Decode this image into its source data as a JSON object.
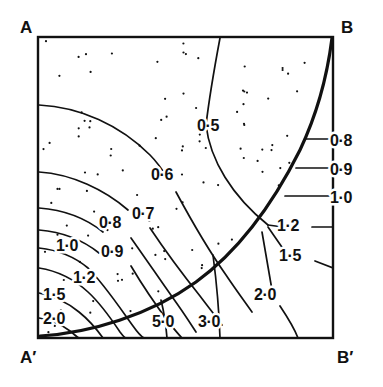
{
  "figure": {
    "title": "",
    "corner_labels": [
      {
        "name": "top-left",
        "text": "A",
        "x": 20,
        "y": 33
      },
      {
        "name": "top-right",
        "text": "B",
        "x": 341,
        "y": 33
      },
      {
        "name": "bottom-left",
        "text": "A′",
        "x": 20,
        "y": 363
      },
      {
        "name": "bottom-right",
        "text": "B′",
        "x": 337,
        "y": 363
      }
    ],
    "frame": {
      "x": 38,
      "y": 37,
      "width": 295,
      "height": 301,
      "stroke": "#111111",
      "fill": "#ffffff"
    },
    "stipple": {
      "description": "random dot shading of the region above/left of the thick boundary curve",
      "dot_color": "#111111",
      "dot_radius": 1.1,
      "count": 150
    }
  },
  "chart_data": {
    "type": "line",
    "title": "",
    "xlabel": "",
    "ylabel": "",
    "grid": false,
    "legend": "none",
    "contour_labels": [
      {
        "value": "0·5",
        "x": 208,
        "y": 131
      },
      {
        "value": "0·6",
        "x": 162,
        "y": 180
      },
      {
        "value": "0·7",
        "x": 143,
        "y": 219
      },
      {
        "value": "0·8",
        "x": 110,
        "y": 228
      },
      {
        "value": "0·9",
        "x": 112,
        "y": 257
      },
      {
        "value": "1·0",
        "x": 67,
        "y": 251
      },
      {
        "value": "1·2",
        "x": 84,
        "y": 283
      },
      {
        "value": "1·5",
        "x": 54,
        "y": 300
      },
      {
        "value": "2·0",
        "x": 54,
        "y": 324
      },
      {
        "value": "5·0",
        "x": 163,
        "y": 327
      },
      {
        "value": "3·0",
        "x": 209,
        "y": 327
      },
      {
        "value": "0·8",
        "x": 341,
        "y": 146
      },
      {
        "value": "0·9",
        "x": 341,
        "y": 175
      },
      {
        "value": "1·0",
        "x": 341,
        "y": 203
      },
      {
        "value": "1·2",
        "x": 288,
        "y": 231
      },
      {
        "value": "1·5",
        "x": 290,
        "y": 261
      },
      {
        "value": "2·0",
        "x": 265,
        "y": 300
      }
    ],
    "levels": [
      "0·5",
      "0·6",
      "0·7",
      "0·8",
      "0·9",
      "1·0",
      "1·2",
      "1·5",
      "2·0",
      "3·0",
      "5·0"
    ],
    "curves": [
      {
        "name": "boundary",
        "label": "",
        "weight": "thick",
        "path": "M 40,336 C 90,333 150,315 196,282 C 240,250 275,200 300,150 C 318,112 328,70 332,38"
      },
      {
        "name": "c-0.5",
        "label": "0·5",
        "path": "M 220,38 C 214,70 209,100 206,125 C 210,160 232,196 268,225"
      },
      {
        "name": "c-0.6-left",
        "label": "0·6",
        "path": "M 39,105 C 80,107 120,125 150,155 C 158,163 164,172 169,180"
      },
      {
        "name": "c-0.6-right",
        "label": "0·6",
        "path": "M 176,192 C 190,218 207,248 226,275 C 236,290 245,302 252,312"
      },
      {
        "name": "c-0.7-left",
        "label": "0·7",
        "path": "M 39,172 C 72,174 105,190 128,210"
      },
      {
        "name": "c-0.7-right",
        "label": "0·7",
        "path": "M 150,228 C 166,252 184,276 200,296 C 209,308 217,318 222,325"
      },
      {
        "name": "c-0.8-left",
        "label": "0·8",
        "path": "M 39,208 C 66,210 88,220 103,232"
      },
      {
        "name": "c-0.8-right",
        "label": "0·8",
        "path": "M 131,238 C 148,262 165,287 180,308 C 187,318 192,326 196,332"
      },
      {
        "name": "c-0.9-left",
        "label": "0·9",
        "path": "M 39,230 C 63,232 84,241 99,253"
      },
      {
        "name": "c-0.9-right",
        "label": "0·9",
        "path": "M 131,266 C 144,288 158,308 170,324 C 175,330 179,335 182,338"
      },
      {
        "name": "c-1.0",
        "label": "1·0",
        "path": "M 39,248 C 58,250 76,258 88,268 C 104,284 120,308 133,326 C 138,333 142,337 144,338"
      },
      {
        "name": "c-1.2",
        "label": "1·2",
        "path": "M 39,268 C 58,271 75,280 88,292 C 100,303 112,320 120,332 C 123,336 125,338 126,338"
      },
      {
        "name": "c-1.5",
        "label": "1·5",
        "path": "M 39,293 C 55,296 68,303 79,312 C 89,320 98,331 103,338"
      },
      {
        "name": "c-2.0",
        "label": "2·0",
        "path": "M 39,318 C 52,320 62,325 70,331 C 75,335 78,338 79,338"
      },
      {
        "name": "c-5.0",
        "label": "5·0",
        "path": "M 161,300 C 164,312 166,326 167,338"
      },
      {
        "name": "c-3.0",
        "label": "3·0",
        "path": "M 213,255 C 216,278 219,308 220,338"
      },
      {
        "name": "c-right-0.8",
        "label": "0·8",
        "path": "M 305,139 L 333,139"
      },
      {
        "name": "c-right-0.9",
        "label": "0·9",
        "path": "M 296,168 L 333,168"
      },
      {
        "name": "c-right-1.0",
        "label": "1·0",
        "path": "M 285,196 L 333,196"
      },
      {
        "name": "c-right-1.2",
        "label": "1·2",
        "path": "M 268,225 L 283,227"
      },
      {
        "name": "c-right-1.2-b",
        "label": "1·2",
        "path": "M 312,227 L 333,227"
      },
      {
        "name": "c-right-1.5",
        "label": "1·5",
        "path": "M 268,227 L 286,253"
      },
      {
        "name": "c-right-1.5-b",
        "label": "1·5",
        "path": "M 315,261 L 333,268"
      },
      {
        "name": "c-right-2.0",
        "label": "2·0",
        "path": "M 262,232 L 272,290"
      },
      {
        "name": "c-right-2.0-b",
        "label": "2·0",
        "path": "M 280,306 C 288,318 295,330 298,338"
      }
    ]
  }
}
